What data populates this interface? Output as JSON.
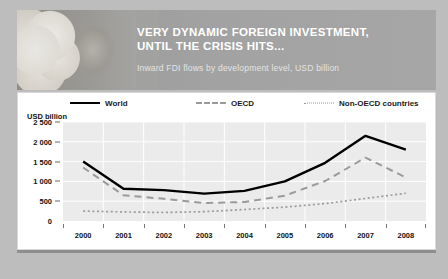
{
  "banner": {
    "title_line1": "VERY DYNAMIC FOREIGN INVESTMENT,",
    "title_line2": "UNTIL THE CRISIS HITS...",
    "subtitle": "Inward FDI flows by development level, USD billion",
    "photo_alt": "eggs-in-basket-photo"
  },
  "chart_data": {
    "type": "line",
    "title": "Inward FDI flows by development level, USD billion",
    "xlabel": "",
    "ylabel": "USD billion",
    "unit_label": "USD billion",
    "categories": [
      "2000",
      "2001",
      "2002",
      "2003",
      "2004",
      "2005",
      "2006",
      "2007",
      "2008"
    ],
    "ylim": [
      0,
      2500
    ],
    "yticks": [
      0,
      500,
      1000,
      1500,
      2000,
      2500
    ],
    "ytick_labels": [
      "0",
      "500",
      "1 000",
      "1 500",
      "2 000",
      "2 500"
    ],
    "grid": true,
    "legend_position": "top",
    "series": [
      {
        "name": "World",
        "style": "solid",
        "color": "#000000",
        "values": [
          1500,
          815,
          780,
          690,
          760,
          1000,
          1470,
          2150,
          1800
        ]
      },
      {
        "name": "OECD",
        "style": "dashed",
        "color": "#9a9a9a",
        "values": [
          1350,
          650,
          560,
          455,
          480,
          640,
          1010,
          1600,
          1100
        ]
      },
      {
        "name": "Non-OECD countries",
        "style": "dotted",
        "color": "#9a9a9a",
        "values": [
          250,
          230,
          215,
          235,
          290,
          350,
          440,
          570,
          700
        ]
      }
    ]
  }
}
